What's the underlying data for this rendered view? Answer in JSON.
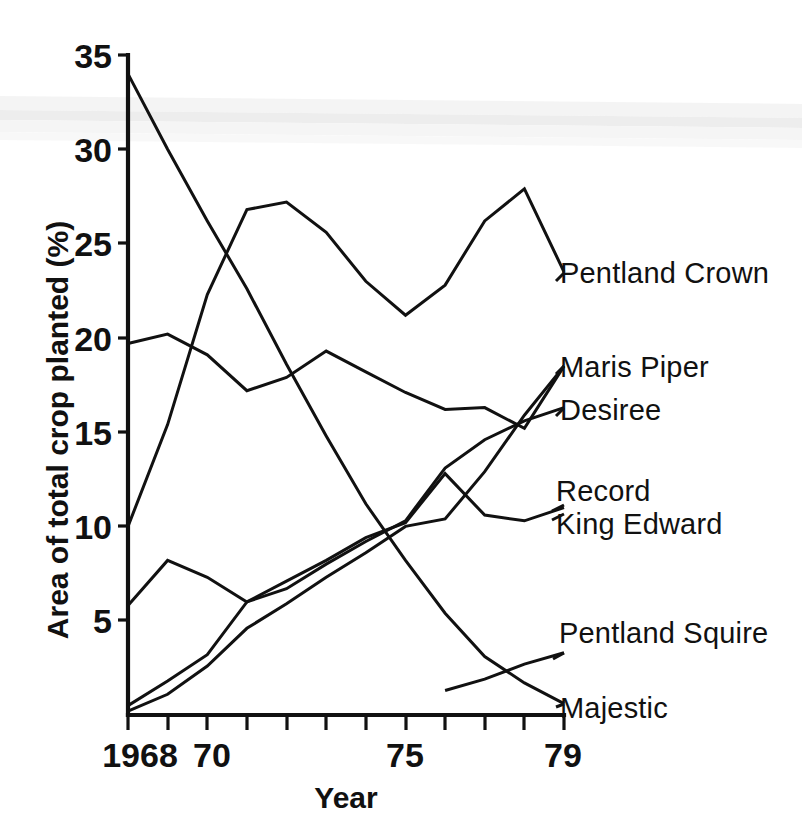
{
  "chart_data": {
    "type": "line",
    "title": "",
    "xlabel": "Year",
    "ylabel": "Area of total crop planted (%)",
    "xlim": [
      1968,
      1979
    ],
    "ylim": [
      0,
      35
    ],
    "grid": false,
    "legend_position": "right-inline-labels",
    "x": [
      1968,
      1969,
      1970,
      1971,
      1972,
      1973,
      1974,
      1975,
      1976,
      1977,
      1978,
      1979
    ],
    "xticks": [
      1968,
      1969,
      1970,
      1971,
      1972,
      1973,
      1974,
      1975,
      1976,
      1977,
      1978,
      1979
    ],
    "xtick_labels": [
      "1968",
      "",
      "70",
      "",
      "",
      "",
      "",
      "75",
      "",
      "",
      "",
      "79"
    ],
    "yticks": [
      5,
      10,
      15,
      20,
      25,
      30,
      35
    ],
    "ytick_labels": [
      "5",
      "10",
      "15",
      "20",
      "25",
      "30",
      "35"
    ],
    "series": [
      {
        "name": "Pentland Crown",
        "label": "Pentland Crown",
        "x": [
          1968,
          1969,
          1970,
          1971,
          1972,
          1973,
          1974,
          1975,
          1976,
          1977,
          1978,
          1979
        ],
        "values": [
          10.0,
          15.4,
          22.3,
          26.8,
          27.2,
          25.6,
          23.0,
          21.2,
          22.8,
          26.2,
          27.9,
          23.5
        ]
      },
      {
        "name": "Maris Piper",
        "label": "Maris Piper",
        "x": [
          1968,
          1969,
          1970,
          1971,
          1972,
          1973,
          1974,
          1975,
          1976,
          1977,
          1978,
          1979
        ],
        "values": [
          0.2,
          1.1,
          2.6,
          4.6,
          5.9,
          7.3,
          8.6,
          10.0,
          10.4,
          12.9,
          15.9,
          18.5
        ]
      },
      {
        "name": "Desiree",
        "label": "Desiree",
        "x": [
          1968,
          1969,
          1970,
          1971,
          1972,
          1973,
          1974,
          1975,
          1976,
          1977,
          1978,
          1979
        ],
        "values": [
          0.5,
          1.8,
          3.2,
          6.0,
          6.7,
          8.0,
          9.2,
          10.3,
          13.1,
          14.6,
          15.6,
          16.3
        ]
      },
      {
        "name": "Record",
        "label": "Record",
        "x": [
          1968,
          1969,
          1970,
          1971,
          1972,
          1973,
          1974,
          1975,
          1976,
          1977,
          1978,
          1979
        ],
        "values": [
          5.8,
          8.2,
          7.3,
          6.0,
          7.1,
          8.2,
          9.4,
          10.2,
          12.8,
          10.6,
          10.3,
          11.0
        ]
      },
      {
        "name": "King Edward",
        "label": "King Edward",
        "x": [
          1968,
          1969,
          1970,
          1971,
          1972,
          1973,
          1974,
          1975,
          1976,
          1977,
          1978,
          1979
        ],
        "values": [
          19.7,
          20.2,
          19.1,
          17.2,
          17.9,
          19.3,
          18.2,
          17.1,
          16.2,
          16.3,
          15.2,
          18.5
        ]
      },
      {
        "name": "Pentland Squire",
        "label": "Pentland Squire",
        "x": [
          1976,
          1977,
          1978,
          1979
        ],
        "values": [
          1.3,
          1.9,
          2.7,
          3.3
        ]
      },
      {
        "name": "Majestic",
        "label": "Majestic",
        "x": [
          1968,
          1969,
          1970,
          1971,
          1972,
          1973,
          1974,
          1975,
          1976,
          1977,
          1978,
          1979
        ],
        "values": [
          34.0,
          30.0,
          26.2,
          22.6,
          18.6,
          14.8,
          11.2,
          8.2,
          5.4,
          3.1,
          1.7,
          0.6
        ]
      }
    ]
  },
  "axes": {
    "x_title": "Year",
    "y_title": "Area of total crop planted (%)",
    "y_title_main": "Area of total crop planted",
    "y_title_unit": "(%)"
  },
  "labels": {
    "pentland_crown": "Pentland Crown",
    "maris_piper": "Maris Piper",
    "desiree": "Desiree",
    "record": "Record",
    "king_edward": "King Edward",
    "pentland_squire": "Pentland Squire",
    "majestic": "Majestic"
  },
  "ticks": {
    "y": [
      "35",
      "30",
      "25",
      "20",
      "15",
      "10",
      "5"
    ],
    "x_1968": "1968",
    "x_70": "70",
    "x_75": "75",
    "x_79": "79"
  },
  "colors": {
    "ink": "#111111",
    "background": "#ffffff",
    "scan_band": "#d8d8d8"
  }
}
